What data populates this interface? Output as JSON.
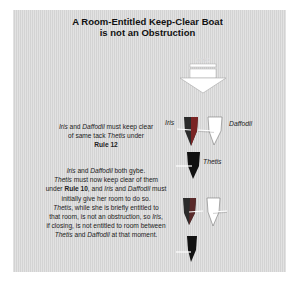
{
  "title": {
    "line1": "A Room-Entitled Keep-Clear Boat",
    "line2": "is not an Obstruction"
  },
  "wind": {
    "label": "WIND",
    "icon": "down-arrow-icon",
    "fill": "#ffffff"
  },
  "boats": [
    {
      "name": "Iris",
      "label": "Iris",
      "colors": [
        "#2b2b2b",
        "#8a2a2a"
      ]
    },
    {
      "name": "Daffodil",
      "label": "Daffodil",
      "colors": [
        "#ffffff"
      ]
    },
    {
      "name": "Thetis",
      "label": "Thetis",
      "colors": [
        "#111111"
      ]
    }
  ],
  "text_blocks": [
    {
      "lines": [
        {
          "parts": [
            {
              "t": "Iris",
              "i": true
            },
            {
              "t": " and "
            },
            {
              "t": "Daffodil",
              "i": true
            },
            {
              "t": " must keep clear"
            }
          ]
        },
        {
          "parts": [
            {
              "t": "of same tack "
            },
            {
              "t": "Thetis",
              "i": true
            },
            {
              "t": " under"
            }
          ]
        },
        {
          "parts": [
            {
              "t": "Rule 12",
              "b": true
            }
          ]
        }
      ]
    },
    {
      "lines": [
        {
          "parts": [
            {
              "t": "Iris",
              "i": true
            },
            {
              "t": " and "
            },
            {
              "t": "Daffodil",
              "i": true
            },
            {
              "t": " both gybe."
            }
          ]
        },
        {
          "parts": [
            {
              "t": "Thetis",
              "i": true
            },
            {
              "t": " must now keep clear of them"
            }
          ]
        },
        {
          "parts": [
            {
              "t": "under "
            },
            {
              "t": "Rule 10",
              "b": true
            },
            {
              "t": ", and "
            },
            {
              "t": "Iris",
              "i": true
            },
            {
              "t": " and "
            },
            {
              "t": "Daffodil",
              "i": true
            },
            {
              "t": " must"
            }
          ]
        },
        {
          "parts": [
            {
              "t": "initially give her room to do so."
            }
          ]
        },
        {
          "parts": [
            {
              "t": "Thetis",
              "i": true
            },
            {
              "t": ", while she is briefly entitled to"
            }
          ]
        },
        {
          "parts": [
            {
              "t": "that room, is not an obstruction, so "
            },
            {
              "t": "Iris",
              "i": true
            },
            {
              "t": ","
            }
          ]
        },
        {
          "parts": [
            {
              "t": "if closing, is not entitled to room between"
            }
          ]
        },
        {
          "parts": [
            {
              "t": "Thetis",
              "i": true
            },
            {
              "t": " and "
            },
            {
              "t": "Daffodil",
              "i": true
            },
            {
              "t": " at that moment."
            }
          ]
        }
      ]
    }
  ],
  "colors": {
    "panel": "#d9d9d9",
    "text": "#222222",
    "boat_dark": "#111111",
    "boat_iris_accent": "#8a2a2a",
    "boat_white": "#ffffff"
  }
}
